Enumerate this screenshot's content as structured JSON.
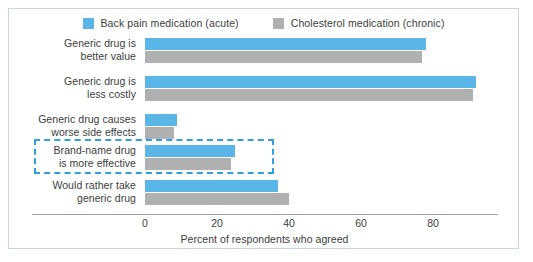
{
  "chart_data": {
    "type": "bar",
    "orientation": "horizontal",
    "title": "",
    "xlabel": "Percent of respondents who agreed",
    "ylabel": "",
    "xlim": [
      0,
      95
    ],
    "xticks": [
      0,
      20,
      40,
      60,
      80
    ],
    "grid": false,
    "legend_position": "top-center",
    "categories": [
      "Generic drug is\nbetter value",
      "Generic drug is\nless costly",
      "Generic drug causes\nworse side effects",
      "Brand-name drug\nis more effective",
      "Would rather take\ngeneric drug"
    ],
    "series": [
      {
        "name": "Back pain medication  (acute)",
        "color": "#5bb6e8",
        "values": [
          78,
          92,
          9,
          25,
          37
        ]
      },
      {
        "name": "Cholesterol medication  (chronic)",
        "color": "#b0b0b0",
        "values": [
          77,
          91,
          8,
          24,
          40
        ]
      }
    ],
    "annotations": [
      {
        "type": "highlight-box",
        "style": "dashed",
        "color": "#2f9fe0",
        "target_category": "Brand-name drug\nis more effective"
      }
    ]
  },
  "legend": {
    "items": [
      {
        "label": "Back pain medication  (acute)",
        "color": "#5bb6e8"
      },
      {
        "label": "Cholesterol medication  (chronic)",
        "color": "#b0b0b0"
      }
    ]
  },
  "axis": {
    "x_title": "Percent of respondents who agreed",
    "ticks": [
      "0",
      "20",
      "40",
      "60",
      "80"
    ]
  },
  "categories": [
    {
      "line1": "Generic drug is",
      "line2": "better value"
    },
    {
      "line1": "Generic drug is",
      "line2": "less costly"
    },
    {
      "line1": "Generic drug causes",
      "line2": "worse side effects"
    },
    {
      "line1": "Brand-name drug",
      "line2": "is more effective"
    },
    {
      "line1": "Would rather take",
      "line2": "generic drug"
    }
  ],
  "colors": {
    "series_blue": "#5bb6e8",
    "series_gray": "#b0b0b0",
    "highlight": "#2f9fe0",
    "frame_border": "#c9d6de",
    "axis_line": "#9aa6ad",
    "text": "#3d3d3d"
  }
}
